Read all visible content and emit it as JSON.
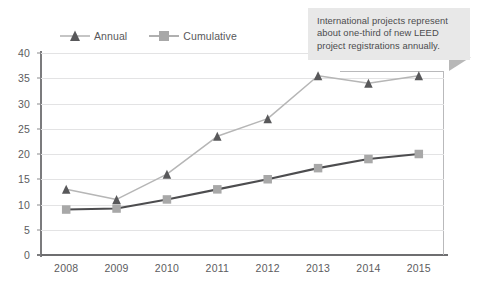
{
  "chart_data": {
    "type": "line",
    "title": "",
    "subtitle": "",
    "xlabel": "",
    "ylabel": "",
    "categories": [
      "2008",
      "2009",
      "2010",
      "2011",
      "2012",
      "2013",
      "2014",
      "2015"
    ],
    "series": [
      {
        "name": "Annual",
        "values": [
          13,
          11,
          16,
          23.5,
          27,
          35.5,
          34,
          35.5
        ],
        "line_color": "#b6b6b6",
        "marker_color": "#58585a",
        "marker": "triangle"
      },
      {
        "name": "Cumulative",
        "values": [
          9,
          9.2,
          11,
          13,
          15,
          17.2,
          19,
          20
        ],
        "line_color": "#4d4d4f",
        "marker_color": "#a8a8a8",
        "marker": "square"
      }
    ],
    "ylim": [
      0,
      40
    ],
    "ytick_values": [
      0,
      5,
      10,
      15,
      20,
      25,
      30,
      35,
      40
    ],
    "ytick_labels": [
      "0",
      "5",
      "10",
      "15",
      "20",
      "25",
      "30",
      "35",
      "40"
    ],
    "grid": true,
    "legend_position": "top-left"
  },
  "legend": {
    "items": [
      {
        "label": "Annual",
        "marker": "triangle-marker"
      },
      {
        "label": "Cumulative",
        "marker": "square-marker"
      }
    ]
  },
  "callout": {
    "text": "International projects represent about one-third of new LEED project registrations annually.",
    "background": "#e8e8e8",
    "tail_color": "#b8b8b8"
  },
  "colors": {
    "grid": "#e3e3e4",
    "axis": "#6e6e70",
    "tick_text": "#5c5c5e",
    "annual_line": "#b6b6b6",
    "annual_marker": "#58585a",
    "cumulative_line": "#4d4d4f",
    "cumulative_marker": "#a8a8a8"
  }
}
